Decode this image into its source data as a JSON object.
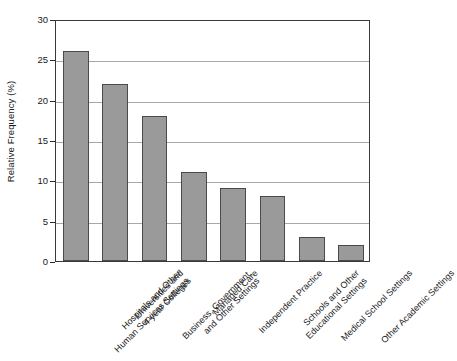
{
  "chart_data": {
    "type": "bar",
    "title": "",
    "subtitle": "",
    "xlabel": "",
    "ylabel": "Relative Frequency (%)",
    "ylim": [
      0,
      30
    ],
    "yticks": [
      0,
      5,
      10,
      15,
      20,
      25,
      30
    ],
    "ytick_labels": [
      "0",
      "5",
      "10",
      "15",
      "20",
      "25",
      "30"
    ],
    "grid": "horizontal",
    "legend": "none",
    "bar_color": "#9a9a9a",
    "bar_edge_color": "#4a4a4a",
    "frame_color": "#3a3a3a",
    "gridline_color": "#a8a8a8",
    "categories": [
      "Hospitals and Other Human Services Settings",
      "Universities and 4-year Colleges",
      "Business, Government, and Other Settings",
      "Managed Care",
      "Independent Practice",
      "Schools and Other Educational Settings",
      "Medical School Settings",
      "Other Academic Settings"
    ],
    "category_lines": [
      [
        "Hospitals and Other",
        "Human Services Settings"
      ],
      [
        "Universities and",
        "4-year Colleges"
      ],
      [
        "Business, Government,",
        "and Other Settings"
      ],
      [
        "Managed Care",
        ""
      ],
      [
        "Independent Practice",
        ""
      ],
      [
        "Schools and Other",
        "Educational Settings"
      ],
      [
        "Medical School Settings",
        ""
      ],
      [
        "Other Academic Settings",
        ""
      ]
    ],
    "values": [
      26,
      22,
      18,
      11,
      9,
      8,
      3,
      2
    ]
  }
}
